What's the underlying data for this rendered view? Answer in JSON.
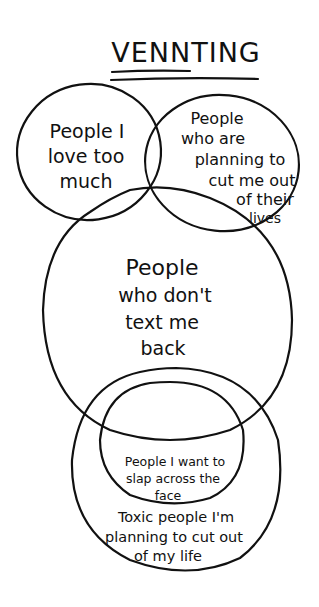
{
  "diagram": {
    "title": "VENNTING",
    "stroke_color": "#111111",
    "background": "#ffffff",
    "sets": [
      {
        "id": "love",
        "lines": [
          "People I",
          "love too",
          "much"
        ]
      },
      {
        "id": "cut-me-out",
        "lines": [
          "People",
          "who are",
          "planning to",
          "cut me out",
          "of their",
          "lives"
        ]
      },
      {
        "id": "no-text-back",
        "lines": [
          "People",
          "who don't",
          "text me",
          "back"
        ]
      },
      {
        "id": "slap",
        "lines": [
          "People I want to",
          "slap across the",
          "face"
        ]
      },
      {
        "id": "toxic",
        "lines": [
          "Toxic people I'm",
          "planning to cut out",
          "of my life"
        ]
      }
    ]
  }
}
